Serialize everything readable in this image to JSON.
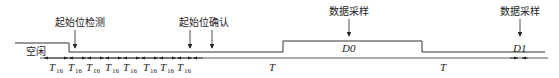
{
  "diagram": {
    "type": "uart-receive-timing",
    "signal_label": "空闲",
    "annotations": [
      {
        "id": "start-detect",
        "label": "起始位检测",
        "x": 75
      },
      {
        "id": "start-confirm",
        "label": "起始位确认",
        "x": 201,
        "arrows_x": [
          190,
          212
        ]
      },
      {
        "id": "data-sample-0",
        "label": "数据采样",
        "x": 349
      },
      {
        "id": "data-sample-1",
        "label": "数据采样",
        "x": 520
      }
    ],
    "bits": [
      {
        "id": "d0",
        "label": "D0"
      },
      {
        "id": "d1",
        "label": "D1"
      }
    ],
    "timing": {
      "sub_period_label": "T",
      "sub_period_subscript": "16",
      "sub_period_count": 8,
      "period_label": "T"
    }
  }
}
